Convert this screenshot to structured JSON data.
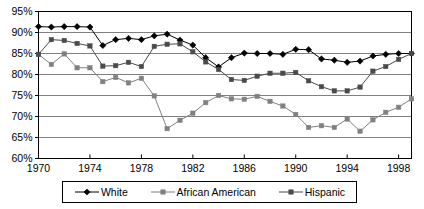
{
  "chart_data": {
    "type": "line",
    "title": "",
    "subtitle": "",
    "xlabel": "",
    "ylabel": "",
    "xlim": [
      1970,
      1999
    ],
    "ylim": [
      60,
      95
    ],
    "ytick_step": 5,
    "xtick_step": 4,
    "grid": true,
    "grid_axis": "y",
    "legend_position": "bottom",
    "x": [
      1970,
      1971,
      1972,
      1973,
      1974,
      1975,
      1976,
      1977,
      1978,
      1979,
      1980,
      1981,
      1982,
      1983,
      1984,
      1985,
      1986,
      1987,
      1988,
      1989,
      1990,
      1991,
      1992,
      1993,
      1994,
      1995,
      1996,
      1997,
      1998,
      1999
    ],
    "ytick_labels": [
      "60%",
      "65%",
      "70%",
      "75%",
      "80%",
      "85%",
      "90%",
      "95%"
    ],
    "ytick_values": [
      60,
      65,
      70,
      75,
      80,
      85,
      90,
      95
    ],
    "xtick_labels": [
      "1970",
      "1974",
      "1978",
      "1982",
      "1986",
      "1990",
      "1994",
      "1998"
    ],
    "xtick_values": [
      1970,
      1974,
      1978,
      1982,
      1986,
      1990,
      1994,
      1998
    ],
    "series": [
      {
        "name": "White",
        "color": "#000000",
        "marker": "diamond",
        "values": [
          91.4,
          91.3,
          91.4,
          91.4,
          91.3,
          86.9,
          88.3,
          88.6,
          88.3,
          89.2,
          89.6,
          88.2,
          87.0,
          84.0,
          81.8,
          84.0,
          85.1,
          85.0,
          85.0,
          84.8,
          86.0,
          85.9,
          83.7,
          83.4,
          82.9,
          83.2,
          84.4,
          84.8,
          85.0,
          85.0
        ]
      },
      {
        "name": "African American",
        "color": "#808080",
        "marker": "square",
        "values": [
          84.8,
          82.4,
          84.9,
          81.6,
          81.6,
          78.3,
          79.3,
          78.0,
          79.1,
          74.9,
          67.1,
          69.1,
          70.8,
          73.3,
          75.0,
          74.2,
          74.1,
          74.8,
          73.6,
          72.5,
          70.5,
          67.4,
          67.8,
          67.4,
          69.4,
          66.5,
          69.2,
          71.0,
          72.2,
          74.2
        ]
      },
      {
        "name": "Hispanic",
        "color": "#4a4a4a",
        "marker": "square",
        "values": [
          84.8,
          88.3,
          88.1,
          87.4,
          86.8,
          82.0,
          82.1,
          82.9,
          81.9,
          86.7,
          87.2,
          87.3,
          85.4,
          83.0,
          81.2,
          78.8,
          78.6,
          79.6,
          80.3,
          80.3,
          80.5,
          78.5,
          77.1,
          76.1,
          76.1,
          77.0,
          80.8,
          81.9,
          83.6,
          85.0
        ]
      }
    ]
  },
  "legend": {
    "items": [
      {
        "label": "White",
        "marker": "diamond-marker",
        "color": "#000000"
      },
      {
        "label": "African American",
        "marker": "square-marker",
        "color": "#808080"
      },
      {
        "label": "Hispanic",
        "marker": "square-marker",
        "color": "#4a4a4a"
      }
    ]
  },
  "plot_area": {
    "border_color": "#000000",
    "grid_color": "#808080",
    "background": "#ffffff"
  }
}
